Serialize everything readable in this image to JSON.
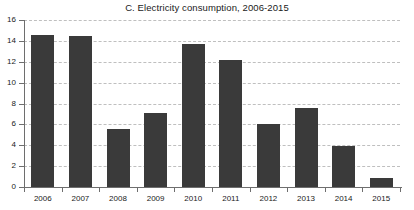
{
  "chart_data": {
    "type": "bar",
    "title": "C. Electricity consumption, 2006-2015",
    "xlabel": "",
    "ylabel": "",
    "categories": [
      "2006",
      "2007",
      "2008",
      "2009",
      "2010",
      "2011",
      "2012",
      "2013",
      "2014",
      "2015"
    ],
    "values": [
      14.6,
      14.5,
      5.6,
      7.1,
      13.7,
      12.2,
      6.0,
      7.6,
      3.9,
      0.9
    ],
    "series": [
      {
        "name": "Electricity consumption",
        "values": [
          14.6,
          14.5,
          5.6,
          7.1,
          13.7,
          12.2,
          6.0,
          7.6,
          3.9,
          0.9
        ]
      }
    ],
    "ylim": [
      0,
      16
    ],
    "yticks": [
      0,
      2,
      4,
      6,
      8,
      10,
      12,
      14,
      16
    ],
    "ytick_labels": [
      "0",
      "2",
      "4",
      "6",
      "8",
      "10",
      "12",
      "14",
      "16"
    ],
    "grid": "horizontal-dashed",
    "legend": "none",
    "bar_color": "#3a3a3a",
    "gridline_color": "#bfbfbf",
    "axis_color": "#6e6e6e",
    "background_color": "#ffffff"
  }
}
